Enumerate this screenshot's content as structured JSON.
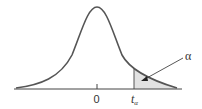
{
  "diagram": {
    "title": "",
    "type": "t-distribution density curve with right-tail area",
    "labels": {
      "zero": "0",
      "t_main": "t",
      "t_sub": "α",
      "alpha": "α"
    },
    "colors": {
      "curve": "#555555",
      "shade": "#e2e2e2",
      "axis": "#444444"
    }
  }
}
